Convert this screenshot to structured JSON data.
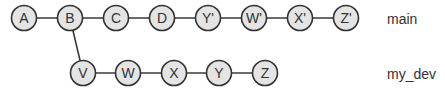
{
  "diagram": {
    "type": "git-commit-graph",
    "branches": [
      {
        "name": "main",
        "label": "main",
        "commits": [
          "A",
          "B",
          "C",
          "D",
          "Y'",
          "W'",
          "X'",
          "Z'"
        ]
      },
      {
        "name": "my_dev",
        "label": "my_dev",
        "forked_from": "B",
        "commits": [
          "V",
          "W",
          "X",
          "Y",
          "Z"
        ]
      }
    ],
    "nodes": {
      "A": {
        "label": "A"
      },
      "B": {
        "label": "B"
      },
      "C": {
        "label": "C"
      },
      "D": {
        "label": "D"
      },
      "Yp": {
        "label": "Y'"
      },
      "Wp": {
        "label": "W'"
      },
      "Xp": {
        "label": "X'"
      },
      "Zp": {
        "label": "Z'"
      },
      "V": {
        "label": "V"
      },
      "W": {
        "label": "W"
      },
      "X": {
        "label": "X"
      },
      "Y": {
        "label": "Y"
      },
      "Z": {
        "label": "Z"
      }
    },
    "colors": {
      "node_fill": "#e4e4e4",
      "node_stroke": "#333333",
      "edge": "#3a3a3a",
      "text": "#333333"
    }
  }
}
